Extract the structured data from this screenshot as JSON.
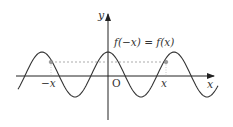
{
  "diagram": {
    "axes": {
      "x_label": "x",
      "y_label": "y",
      "origin_label": "O"
    },
    "equation_label": "f(−x) = f(x)",
    "point_labels": {
      "negative": "−x",
      "positive": "x"
    },
    "colors": {
      "curve": "#333333",
      "axis": "#222222",
      "dashed": "#888888",
      "point": "#999999"
    }
  }
}
